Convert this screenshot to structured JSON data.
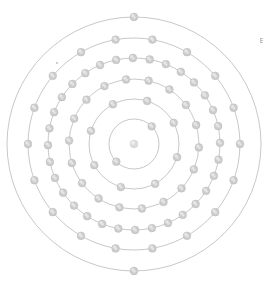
{
  "figure": {
    "background_color": "#ffffff",
    "width": 263,
    "height": 286,
    "center": {
      "x": 134,
      "y": 144
    }
  },
  "caption": {
    "line1": "Element",
    "line2": "2"
  },
  "nucleus": {
    "label": "nucleus",
    "radius": 4.0,
    "color": "#dcdcdc"
  },
  "style": {
    "ring_color": "#9a9a9a",
    "ring_width": 0.55,
    "electron_fill": "#cdcdcd",
    "electron_stroke": "#b4b4b4",
    "electron_radius": 3.9,
    "text_color": "#9c9c9c"
  },
  "speck": {
    "x": 57,
    "y": 63,
    "r": 0.9
  },
  "chart_data": {
    "type": "scatter",
    "subtitle": "",
    "xlabel": "",
    "ylabel": "",
    "grid": false,
    "legend": "none",
    "shell_labels": [
      "K",
      "L",
      "M",
      "N",
      "O",
      "P"
    ],
    "categories": [
      "Shell 1",
      "Shell 2",
      "Shell 3",
      "Shell 4",
      "Shell 5",
      "Shell 6"
    ],
    "values": [
      2,
      8,
      18,
      32,
      18,
      2
    ],
    "electron_total": 80,
    "shells": [
      {
        "index": 1,
        "name": "K",
        "radius": 25,
        "electrons": 2,
        "start_angle": -225
      },
      {
        "index": 2,
        "name": "L",
        "radius": 45,
        "electrons": 8,
        "start_angle": -208
      },
      {
        "index": 3,
        "name": "M",
        "radius": 65,
        "electrons": 18,
        "start_angle": -197
      },
      {
        "index": 4,
        "name": "N",
        "radius": 86,
        "electrons": 32,
        "start_angle": -192
      },
      {
        "index": 5,
        "name": "O",
        "radius": 106,
        "electrons": 18,
        "start_angle": -180
      },
      {
        "index": 6,
        "name": "P",
        "radius": 127,
        "electrons": 2,
        "start_angle": -90
      }
    ]
  }
}
